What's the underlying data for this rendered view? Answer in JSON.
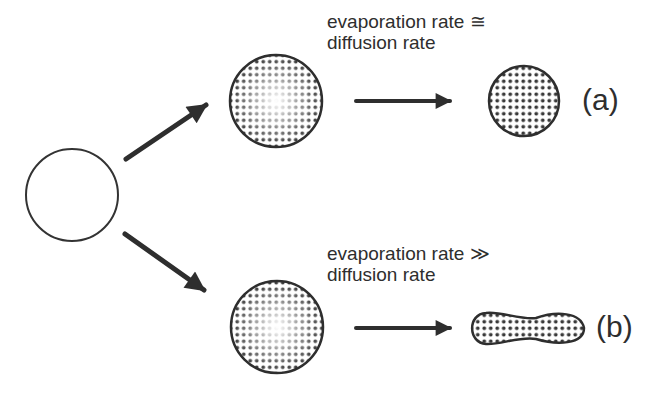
{
  "diagram": {
    "type": "process-flow",
    "nodes": [
      {
        "id": "initial-droplet",
        "shape": "circle",
        "fill": "none"
      },
      {
        "id": "droplet-a-start",
        "shape": "circle",
        "fill": "dotted-gradient"
      },
      {
        "id": "droplet-a-end",
        "shape": "circle",
        "fill": "dotted"
      },
      {
        "id": "droplet-b-start",
        "shape": "circle",
        "fill": "dotted-gradient"
      },
      {
        "id": "droplet-b-end",
        "shape": "dumbbell",
        "fill": "dotted"
      }
    ],
    "edges": [
      {
        "from": "initial-droplet",
        "to": "droplet-a-start"
      },
      {
        "from": "initial-droplet",
        "to": "droplet-b-start"
      },
      {
        "from": "droplet-a-start",
        "to": "droplet-a-end"
      },
      {
        "from": "droplet-b-start",
        "to": "droplet-b-end"
      }
    ]
  },
  "branch_a": {
    "condition_line1": "evaporation rate ≅",
    "condition_line2": "diffusion rate",
    "tag": "(a)"
  },
  "branch_b": {
    "condition_line1": "evaporation rate ≫",
    "condition_line2": "diffusion rate",
    "tag": "(b)"
  },
  "colors": {
    "stroke": "#2e2e2e",
    "dot": "#3a3a3a",
    "background": "#ffffff"
  }
}
